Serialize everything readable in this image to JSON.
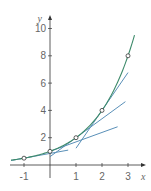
{
  "chart_data": {
    "type": "line",
    "title": "",
    "xlabel": "x",
    "ylabel": "y",
    "xlim": [
      -1.5,
      3.5
    ],
    "ylim": [
      0,
      10.5
    ],
    "grid": false,
    "x_ticks": [
      -1,
      1,
      2,
      3
    ],
    "x_tick_labels": [
      "-1",
      "1",
      "2",
      "3"
    ],
    "y_ticks": [
      2,
      4,
      6,
      8,
      10
    ],
    "y_tick_labels": [
      "2",
      "4",
      "6",
      "8",
      "10"
    ],
    "series": [
      {
        "name": "curve y = 2^x",
        "color": "#3d8a6a",
        "function": "2^x",
        "x": [
          -1.5,
          -1,
          0,
          1,
          2,
          3,
          3.25
        ],
        "y": [
          0.35,
          0.5,
          1,
          2,
          4,
          8,
          9.5
        ]
      },
      {
        "name": "tangent at x=-1",
        "color": "#5a90b8",
        "x": [
          -1.5,
          0.7
        ],
        "y": [
          0.33,
          1.09
        ]
      },
      {
        "name": "tangent at x=0",
        "color": "#5a90b8",
        "x": [
          0,
          2.6
        ],
        "y": [
          1,
          2.8
        ]
      },
      {
        "name": "tangent at x=1",
        "color": "#5a90b8",
        "x": [
          0,
          2.9
        ],
        "y": [
          0.61,
          4.64
        ]
      },
      {
        "name": "tangent at x=2",
        "color": "#5a90b8",
        "x": [
          1,
          3
        ],
        "y": [
          1.23,
          6.77
        ]
      }
    ],
    "points": [
      {
        "x": -1,
        "y": 0.5
      },
      {
        "x": 0,
        "y": 1
      },
      {
        "x": 1,
        "y": 2
      },
      {
        "x": 2,
        "y": 4
      },
      {
        "x": 3,
        "y": 8
      }
    ],
    "annotations": []
  },
  "colors": {
    "curve": "#3d8a6a",
    "tangent": "#5a90b8",
    "axis": "#333333",
    "text": "#666666"
  }
}
